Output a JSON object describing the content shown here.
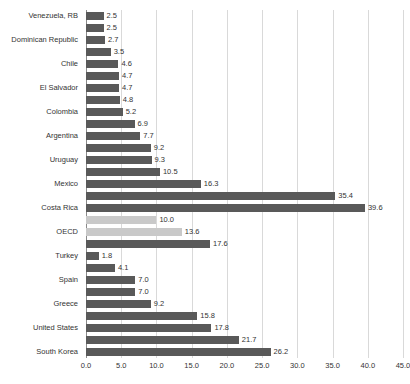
{
  "chart_data": {
    "type": "bar",
    "orientation": "horizontal",
    "title": "",
    "xlabel": "",
    "ylabel": "",
    "xlim": [
      0.0,
      45.0
    ],
    "xticks": [
      "0.0",
      "5.0",
      "10.0",
      "15.0",
      "20.0",
      "25.0",
      "30.0",
      "35.0",
      "40.0",
      "45.0"
    ],
    "xtick_values": [
      0,
      5,
      10,
      15,
      20,
      25,
      30,
      35,
      40,
      45
    ],
    "grid": "vertical",
    "legend": "none",
    "categories": [
      "Venezuela, RB",
      "Dominican Republic",
      "Chile",
      "El Salvador",
      "Colombia",
      "Argentina",
      "Uruguay",
      "Mexico",
      "Costa Rica",
      "OECD",
      "Turkey",
      "Spain",
      "Greece",
      "United States",
      "South Korea"
    ],
    "colors": {
      "bar_default": "#595959",
      "bar_highlight": "#c9c9c9",
      "gridline": "#d9d9d9",
      "axis": "#8a8a8a",
      "text": "#333333"
    },
    "bars": [
      {
        "label": "Venezuela, RB",
        "value": 2.5,
        "value_text": "2.5",
        "style": "default"
      },
      {
        "label": "",
        "value": 2.5,
        "value_text": "2.5",
        "style": "default"
      },
      {
        "label": "Dominican Republic",
        "value": 2.7,
        "value_text": "2.7",
        "style": "default"
      },
      {
        "label": "",
        "value": 3.5,
        "value_text": "3.5",
        "style": "default"
      },
      {
        "label": "Chile",
        "value": 4.6,
        "value_text": "4.6",
        "style": "default"
      },
      {
        "label": "",
        "value": 4.7,
        "value_text": "4.7",
        "style": "default"
      },
      {
        "label": "El Salvador",
        "value": 4.7,
        "value_text": "4.7",
        "style": "default"
      },
      {
        "label": "",
        "value": 4.8,
        "value_text": "4.8",
        "style": "default"
      },
      {
        "label": "Colombia",
        "value": 5.2,
        "value_text": "5.2",
        "style": "default"
      },
      {
        "label": "",
        "value": 6.9,
        "value_text": "6.9",
        "style": "default"
      },
      {
        "label": "Argentina",
        "value": 7.7,
        "value_text": "7.7",
        "style": "default"
      },
      {
        "label": "",
        "value": 9.2,
        "value_text": "9.2",
        "style": "default"
      },
      {
        "label": "Uruguay",
        "value": 9.3,
        "value_text": "9.3",
        "style": "default"
      },
      {
        "label": "",
        "value": 10.5,
        "value_text": "10.5",
        "style": "default"
      },
      {
        "label": "Mexico",
        "value": 16.3,
        "value_text": "16.3",
        "style": "default"
      },
      {
        "label": "",
        "value": 35.4,
        "value_text": "35.4",
        "style": "default"
      },
      {
        "label": "Costa Rica",
        "value": 39.6,
        "value_text": "39.6",
        "style": "default"
      },
      {
        "label": "",
        "value": 10.0,
        "value_text": "10.0",
        "style": "highlight"
      },
      {
        "label": "OECD",
        "value": 13.6,
        "value_text": "13.6",
        "style": "highlight"
      },
      {
        "label": "",
        "value": 17.6,
        "value_text": "17.6",
        "style": "default"
      },
      {
        "label": "Turkey",
        "value": 1.8,
        "value_text": "1.8",
        "style": "default"
      },
      {
        "label": "",
        "value": 4.1,
        "value_text": "4.1",
        "style": "default"
      },
      {
        "label": "Spain",
        "value": 7.0,
        "value_text": "7.0",
        "style": "default"
      },
      {
        "label": "",
        "value": 7.0,
        "value_text": "7.0",
        "style": "default"
      },
      {
        "label": "Greece",
        "value": 9.2,
        "value_text": "9.2",
        "style": "default"
      },
      {
        "label": "",
        "value": 15.8,
        "value_text": "15.8",
        "style": "default"
      },
      {
        "label": "United States",
        "value": 17.8,
        "value_text": "17.8",
        "style": "default"
      },
      {
        "label": "",
        "value": 21.7,
        "value_text": "21.7",
        "style": "default"
      },
      {
        "label": "South Korea",
        "value": 26.2,
        "value_text": "26.2",
        "style": "default"
      }
    ]
  }
}
